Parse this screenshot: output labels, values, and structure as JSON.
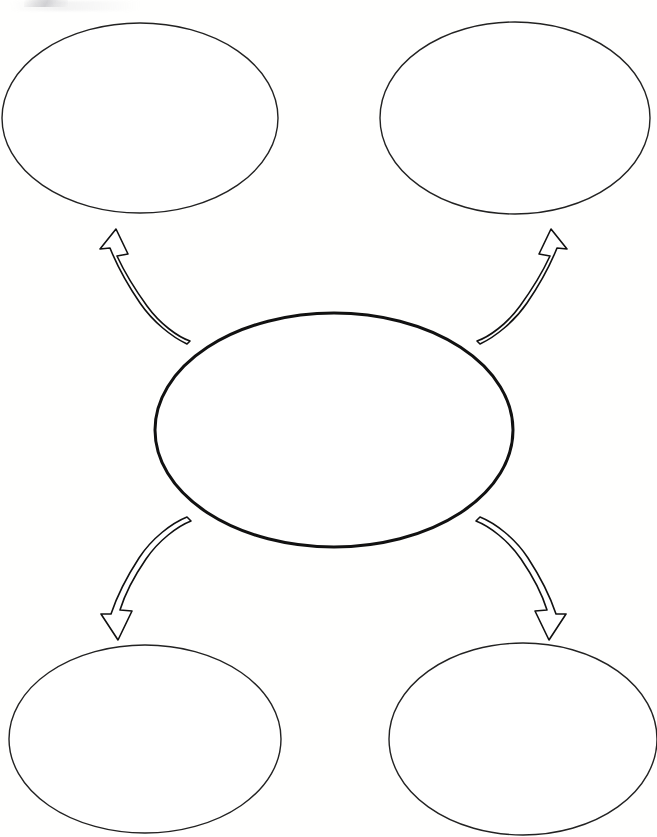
{
  "document": {
    "kind": "graphic-organizer-worksheet",
    "title": "",
    "instructions": "",
    "background_color": "#FFFFFF",
    "ink_color": "#111111",
    "page_width": 657,
    "page_height": 837
  },
  "diagram": {
    "type": "concept-map",
    "layout": "center-node-with-four-radiating-branches",
    "center_node": {
      "id": "center",
      "label": "",
      "shape": "ellipse",
      "cx": 334,
      "cy": 430,
      "rx": 179,
      "ry": 117,
      "stroke_color": "#111111",
      "stroke_width": 3,
      "fill_color": "#FFFFFF"
    },
    "branch_nodes": [
      {
        "id": "top-left",
        "label": "",
        "shape": "ellipse",
        "cx": 140,
        "cy": 118,
        "rx": 138,
        "ry": 95,
        "stroke_color": "#222222",
        "stroke_width": 1.4,
        "fill_color": "#FFFFFF"
      },
      {
        "id": "top-right",
        "label": "",
        "shape": "ellipse",
        "cx": 515,
        "cy": 118,
        "rx": 135,
        "ry": 96,
        "stroke_color": "#222222",
        "stroke_width": 1.4,
        "fill_color": "#FFFFFF"
      },
      {
        "id": "bottom-left",
        "label": "",
        "shape": "ellipse",
        "cx": 145,
        "cy": 739,
        "rx": 136,
        "ry": 94,
        "stroke_color": "#222222",
        "stroke_width": 1.4,
        "fill_color": "#FFFFFF"
      },
      {
        "id": "bottom-right",
        "label": "",
        "shape": "ellipse",
        "cx": 523,
        "cy": 739,
        "rx": 134,
        "ry": 96,
        "stroke_color": "#222222",
        "stroke_width": 1.4,
        "fill_color": "#FFFFFF"
      }
    ],
    "connectors": [
      {
        "id": "center-to-top-left",
        "style": "curved-hollow-ribbon-arrow",
        "from": "center",
        "to": "top-left",
        "direction": "up-left",
        "stroke_color": "#111111",
        "stroke_width": 1.6,
        "fill_color": "#FFFFFF",
        "arrowhead_at": "top"
      },
      {
        "id": "center-to-top-right",
        "style": "curved-hollow-ribbon-arrow",
        "from": "center",
        "to": "top-right",
        "direction": "up-right",
        "stroke_color": "#111111",
        "stroke_width": 1.6,
        "fill_color": "#FFFFFF",
        "arrowhead_at": "top"
      },
      {
        "id": "center-to-bottom-left",
        "style": "curved-hollow-ribbon-arrow",
        "from": "center",
        "to": "bottom-left",
        "direction": "down-left",
        "stroke_color": "#111111",
        "stroke_width": 1.6,
        "fill_color": "#FFFFFF",
        "arrowhead_at": "bottom"
      },
      {
        "id": "center-to-bottom-right",
        "style": "curved-hollow-ribbon-arrow",
        "from": "center",
        "to": "bottom-right",
        "direction": "down-right",
        "stroke_color": "#111111",
        "stroke_width": 1.6,
        "fill_color": "#FFFFFF",
        "arrowhead_at": "bottom"
      }
    ]
  }
}
